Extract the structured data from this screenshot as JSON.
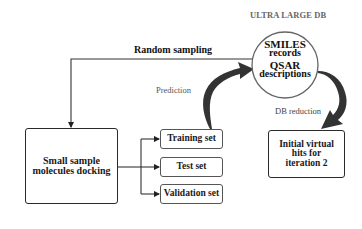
{
  "diagram": {
    "db_header": "ULTRA LARGE DB",
    "db_circle": {
      "line1": "SMILES",
      "line2": "records",
      "line3": "QSAR",
      "line4": "descriptions"
    },
    "edges": {
      "random_sampling": "Random sampling",
      "prediction": "Prediction",
      "db_reduction": "DB reduction"
    },
    "boxes": {
      "docking": {
        "line1": "Small sample",
        "line2": "molecules docking"
      },
      "training": "Training set",
      "test": "Test set",
      "validation": "Validation set",
      "initial_hits": {
        "line1": "Initial virtual",
        "line2": "hits for",
        "line3": "iteration 2"
      }
    },
    "colors": {
      "stroke": "#2a2a2a",
      "curved_arrow": "#333333",
      "gray_text": "#555555"
    }
  }
}
